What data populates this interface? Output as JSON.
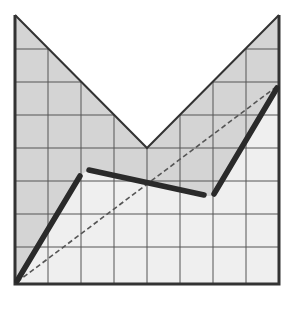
{
  "title": "Puzzle 1",
  "grid": {
    "columns": 8,
    "rows": 8
  },
  "colors": {
    "shaded_region": "#d4d4d4",
    "light_region": "#efefef",
    "grid_line": "#555555",
    "border": "#333333",
    "thick_path": "#2a2a2a",
    "dashed_line": "#555555",
    "title_text": "#4a4a4a"
  },
  "shapes": {
    "v_notch_vertex_grid": [
      4,
      4
    ],
    "thick_path_grid_points": [
      [
        0,
        8
      ],
      [
        2,
        4.7
      ],
      [
        6,
        5.5
      ],
      [
        8,
        2.1
      ]
    ],
    "dashed_line_grid": [
      [
        0,
        8
      ],
      [
        8,
        2.1
      ]
    ]
  }
}
